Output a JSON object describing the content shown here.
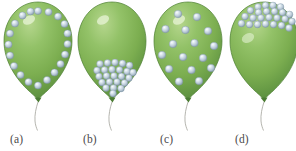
{
  "figure": {
    "background_color": "#ffffff",
    "width": 296,
    "height": 151
  },
  "colors": {
    "balloon_green_light": "#a9cf7f",
    "balloon_green_mid": "#84b455",
    "balloon_green_dark": "#5f9440",
    "balloon_edge": "#4d7f33",
    "sphere_light": "#f2f7fa",
    "sphere_mid": "#c3d2dd",
    "sphere_dark": "#8ea3b4",
    "sphere_edge": "#7d94a6",
    "string": "#a8a8a0",
    "label_text": "#4a4a4a"
  },
  "panels": [
    {
      "id": "a",
      "label": "(a)",
      "label_x": 10,
      "balloon_x": 2,
      "distribution": "perimeter",
      "description": "Spheres arranged around the inner perimeter of the balloon",
      "sphere_count": 20,
      "spheres": [
        {
          "cx": 36.0,
          "cy": 11.0,
          "r": 3.6
        },
        {
          "cx": 46.5,
          "cy": 12.0,
          "r": 3.6
        },
        {
          "cx": 56.0,
          "cy": 16.5,
          "r": 3.6
        },
        {
          "cx": 62.5,
          "cy": 24.0,
          "r": 3.6
        },
        {
          "cx": 65.5,
          "cy": 33.5,
          "r": 3.6
        },
        {
          "cx": 65.5,
          "cy": 44.0,
          "r": 3.6
        },
        {
          "cx": 63.0,
          "cy": 54.5,
          "r": 3.6
        },
        {
          "cx": 58.5,
          "cy": 64.0,
          "r": 3.6
        },
        {
          "cx": 52.5,
          "cy": 72.5,
          "r": 3.6
        },
        {
          "cx": 45.0,
          "cy": 80.0,
          "r": 3.6
        },
        {
          "cx": 36.0,
          "cy": 85.5,
          "r": 3.6
        },
        {
          "cx": 26.5,
          "cy": 82.0,
          "r": 3.6
        },
        {
          "cx": 18.5,
          "cy": 75.0,
          "r": 3.6
        },
        {
          "cx": 12.0,
          "cy": 66.0,
          "r": 3.6
        },
        {
          "cx": 8.0,
          "cy": 55.5,
          "r": 3.6
        },
        {
          "cx": 6.5,
          "cy": 44.5,
          "r": 3.6
        },
        {
          "cx": 8.0,
          "cy": 33.5,
          "r": 3.6
        },
        {
          "cx": 13.0,
          "cy": 23.5,
          "r": 3.6
        },
        {
          "cx": 20.5,
          "cy": 15.5,
          "r": 3.6
        },
        {
          "cx": 28.5,
          "cy": 11.5,
          "r": 3.6
        }
      ]
    },
    {
      "id": "b",
      "label": "(b)",
      "label_x": 83,
      "balloon_x": 76,
      "distribution": "bottom-cluster",
      "description": "Spheres densely clustered at the bottom of the balloon",
      "sphere_count": 24,
      "spheres": [
        {
          "cx": 24.0,
          "cy": 64.0,
          "r": 3.4
        },
        {
          "cx": 31.5,
          "cy": 63.0,
          "r": 3.4
        },
        {
          "cx": 39.0,
          "cy": 62.5,
          "r": 3.4
        },
        {
          "cx": 46.5,
          "cy": 63.5,
          "r": 3.4
        },
        {
          "cx": 53.5,
          "cy": 65.5,
          "r": 3.4
        },
        {
          "cx": 21.0,
          "cy": 70.5,
          "r": 3.4
        },
        {
          "cx": 28.5,
          "cy": 70.0,
          "r": 3.4
        },
        {
          "cx": 36.0,
          "cy": 69.5,
          "r": 3.4
        },
        {
          "cx": 43.5,
          "cy": 70.0,
          "r": 3.4
        },
        {
          "cx": 51.0,
          "cy": 71.5,
          "r": 3.4
        },
        {
          "cx": 57.0,
          "cy": 72.5,
          "r": 3.4
        },
        {
          "cx": 23.0,
          "cy": 76.5,
          "r": 3.4
        },
        {
          "cx": 30.5,
          "cy": 76.0,
          "r": 3.4
        },
        {
          "cx": 38.0,
          "cy": 76.0,
          "r": 3.4
        },
        {
          "cx": 45.5,
          "cy": 76.5,
          "r": 3.4
        },
        {
          "cx": 53.0,
          "cy": 78.0,
          "r": 3.4
        },
        {
          "cx": 26.0,
          "cy": 82.5,
          "r": 3.4
        },
        {
          "cx": 33.5,
          "cy": 82.0,
          "r": 3.4
        },
        {
          "cx": 41.0,
          "cy": 82.0,
          "r": 3.4
        },
        {
          "cx": 48.5,
          "cy": 83.0,
          "r": 3.4
        },
        {
          "cx": 30.0,
          "cy": 88.0,
          "r": 3.4
        },
        {
          "cx": 37.5,
          "cy": 88.0,
          "r": 3.4
        },
        {
          "cx": 45.0,
          "cy": 88.5,
          "r": 3.4
        },
        {
          "cx": 37.0,
          "cy": 93.5,
          "r": 3.4
        }
      ]
    },
    {
      "id": "c",
      "label": "(c)",
      "label_x": 160,
      "balloon_x": 152,
      "distribution": "uniform",
      "description": "Spheres spread evenly throughout the interior of the balloon",
      "sphere_count": 16,
      "spheres": [
        {
          "cx": 26.0,
          "cy": 14.0,
          "r": 3.8
        },
        {
          "cx": 45.0,
          "cy": 17.0,
          "r": 3.8
        },
        {
          "cx": 13.5,
          "cy": 29.0,
          "r": 3.8
        },
        {
          "cx": 33.5,
          "cy": 30.0,
          "r": 3.8
        },
        {
          "cx": 56.0,
          "cy": 31.0,
          "r": 3.8
        },
        {
          "cx": 21.0,
          "cy": 44.0,
          "r": 3.8
        },
        {
          "cx": 42.5,
          "cy": 43.0,
          "r": 3.8
        },
        {
          "cx": 62.0,
          "cy": 46.0,
          "r": 3.8
        },
        {
          "cx": 10.0,
          "cy": 55.0,
          "r": 3.8
        },
        {
          "cx": 31.0,
          "cy": 57.0,
          "r": 3.8
        },
        {
          "cx": 51.0,
          "cy": 58.0,
          "r": 3.8
        },
        {
          "cx": 17.0,
          "cy": 69.0,
          "r": 3.8
        },
        {
          "cx": 39.5,
          "cy": 70.0,
          "r": 3.8
        },
        {
          "cx": 59.0,
          "cy": 68.0,
          "r": 3.8
        },
        {
          "cx": 27.0,
          "cy": 81.5,
          "r": 3.8
        },
        {
          "cx": 47.0,
          "cy": 81.0,
          "r": 3.8
        }
      ]
    },
    {
      "id": "d",
      "label": "(d)",
      "label_x": 235,
      "balloon_x": 228,
      "distribution": "top-cluster",
      "description": "Spheres densely clustered at the top of the balloon",
      "sphere_count": 24,
      "spheres": [
        {
          "cx": 30.0,
          "cy": 7.0,
          "r": 3.4
        },
        {
          "cx": 37.5,
          "cy": 5.5,
          "r": 3.4
        },
        {
          "cx": 45.0,
          "cy": 5.5,
          "r": 3.4
        },
        {
          "cx": 52.5,
          "cy": 7.0,
          "r": 3.4
        },
        {
          "cx": 22.5,
          "cy": 10.5,
          "r": 3.4
        },
        {
          "cx": 30.5,
          "cy": 12.5,
          "r": 3.4
        },
        {
          "cx": 38.5,
          "cy": 11.5,
          "r": 3.4
        },
        {
          "cx": 46.5,
          "cy": 11.5,
          "r": 3.4
        },
        {
          "cx": 54.5,
          "cy": 12.5,
          "r": 3.4
        },
        {
          "cx": 61.5,
          "cy": 14.5,
          "r": 3.4
        },
        {
          "cx": 17.0,
          "cy": 16.5,
          "r": 3.4
        },
        {
          "cx": 25.0,
          "cy": 18.0,
          "r": 3.4
        },
        {
          "cx": 33.0,
          "cy": 18.0,
          "r": 3.4
        },
        {
          "cx": 41.0,
          "cy": 17.5,
          "r": 3.4
        },
        {
          "cx": 49.0,
          "cy": 18.0,
          "r": 3.4
        },
        {
          "cx": 57.0,
          "cy": 19.0,
          "r": 3.4
        },
        {
          "cx": 64.0,
          "cy": 21.5,
          "r": 3.4
        },
        {
          "cx": 13.5,
          "cy": 23.5,
          "r": 3.4
        },
        {
          "cx": 21.5,
          "cy": 24.5,
          "r": 3.4
        },
        {
          "cx": 29.5,
          "cy": 24.5,
          "r": 3.4
        },
        {
          "cx": 37.5,
          "cy": 24.0,
          "r": 3.4
        },
        {
          "cx": 45.5,
          "cy": 24.5,
          "r": 3.4
        },
        {
          "cx": 53.5,
          "cy": 25.5,
          "r": 3.4
        },
        {
          "cx": 61.0,
          "cy": 28.0,
          "r": 3.4
        }
      ]
    }
  ],
  "balloon_shape": {
    "path": "M 36 2 C 56 2 70 20 70 41 C 70 62 57 80 45 91 C 40 95.5 38 97.5 36 99 C 34 97.5 32 95.5 27 91 C 15 80 2 62 2 41 C 2 20 16 2 36 2 Z",
    "knot_path": "M 32.5 97.5 L 39.5 97.5 L 36.5 102.5 Z",
    "string_path": "M 36 102 C 34 108 32.5 115 33 121 C 33.3 125 34.5 128 35.5 130.5",
    "highlight": {
      "cx": 27,
      "cy": 20,
      "rx": 6.5,
      "ry": 4.2
    }
  }
}
